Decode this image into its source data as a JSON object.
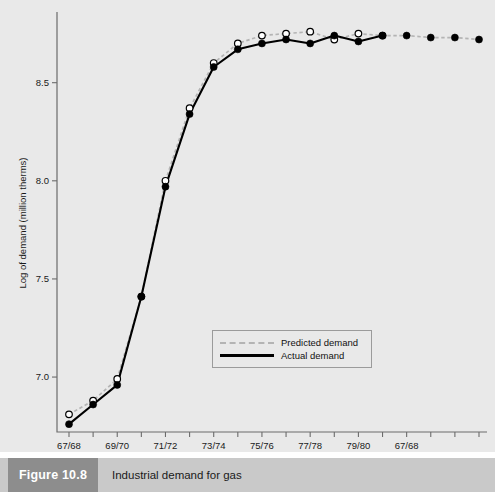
{
  "figure": {
    "number_label": "Figure 10.8",
    "caption": "Industrial demand for gas",
    "footer_note": ""
  },
  "legend": {
    "position": "inside-lower-center",
    "entries": [
      {
        "label": "Predicted demand",
        "style": "dashed",
        "color": "#b4b4b4",
        "marker": "open-circle"
      },
      {
        "label": "Actual demand",
        "style": "solid",
        "color": "#000000",
        "marker": "filled-circle"
      }
    ]
  },
  "chart_data": {
    "type": "line",
    "title": "Industrial demand for gas",
    "xlabel": "",
    "ylabel": "Log of demand (million therms)",
    "grid": false,
    "ylim": [
      6.72,
      8.85
    ],
    "yticks": [
      "7.0",
      "7.5",
      "8.0",
      "8.5"
    ],
    "ytick_values": [
      7.0,
      7.5,
      8.0,
      8.5
    ],
    "x_tick_labels": [
      "67/68",
      "",
      "69/70",
      "",
      "71/72",
      "",
      "73/74",
      "",
      "75/76",
      "",
      "77/78",
      "",
      "79/80",
      "",
      "67/68"
    ],
    "x_major_labels": [
      "67/68",
      "69/70",
      "71/72",
      "73/74",
      "75/76",
      "77/78",
      "79/80",
      "67/68"
    ],
    "x_index": [
      0,
      1,
      2,
      3,
      4,
      5,
      6,
      7,
      8,
      9,
      10,
      11,
      12,
      13,
      14,
      15,
      16,
      17
    ],
    "series": [
      {
        "name": "Actual demand",
        "style": "solid",
        "color": "#000000",
        "marker": "filled-circle",
        "values": [
          6.76,
          6.86,
          6.96,
          7.41,
          7.97,
          8.34,
          8.58,
          8.67,
          8.7,
          8.72,
          8.7,
          8.74,
          8.71,
          8.74,
          null,
          null,
          null,
          null
        ]
      },
      {
        "name": "Predicted demand",
        "style": "dashed",
        "color": "#b4b4b4",
        "marker": "open-circle",
        "values": [
          6.81,
          6.88,
          6.99,
          7.41,
          8.0,
          8.37,
          8.6,
          8.7,
          8.74,
          8.75,
          8.76,
          8.72,
          8.75,
          8.74,
          8.74,
          8.73,
          8.73,
          8.72
        ]
      },
      {
        "name": "Forecast points",
        "style": "dashed",
        "color": "#b4b4b4",
        "marker": "filled-circle",
        "values": [
          null,
          null,
          null,
          null,
          null,
          null,
          null,
          null,
          null,
          null,
          null,
          null,
          null,
          8.74,
          8.74,
          8.73,
          8.73,
          8.72
        ]
      }
    ]
  }
}
